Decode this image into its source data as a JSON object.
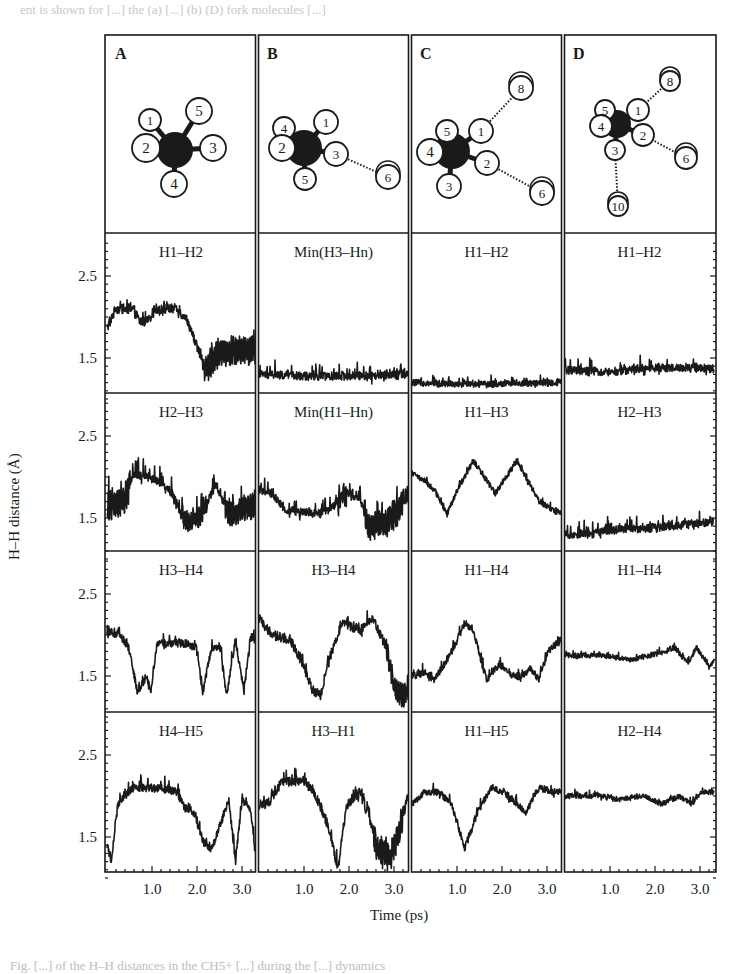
{
  "page": {
    "top_text_fragment": "ent is shown for [...] the (a) [...] (b) (D) fork molecules [...]",
    "bottom_caption_fragment": "Fig. [...] of the H–H distances in the CH5+ [...] during the [...] dynamics"
  },
  "figure": {
    "columns": [
      {
        "label": "A"
      },
      {
        "label": "B"
      },
      {
        "label": "C"
      },
      {
        "label": "D"
      }
    ],
    "molecules": [
      {
        "panel": "A",
        "center": [
          175,
          150
        ],
        "atoms": [
          {
            "n": "1",
            "x": 150,
            "y": 120,
            "r": 11
          },
          {
            "n": "2",
            "x": 146,
            "y": 148,
            "r": 14
          },
          {
            "n": "3",
            "x": 213,
            "y": 148,
            "r": 13
          },
          {
            "n": "4",
            "x": 174,
            "y": 184,
            "r": 13
          },
          {
            "n": "5",
            "x": 199,
            "y": 111,
            "r": 13
          }
        ],
        "bonds_dotted": []
      },
      {
        "panel": "B",
        "center": [
          304,
          148
        ],
        "atoms": [
          {
            "n": "4",
            "x": 284,
            "y": 128,
            "r": 11
          },
          {
            "n": "1",
            "x": 326,
            "y": 122,
            "r": 12
          },
          {
            "n": "2",
            "x": 282,
            "y": 148,
            "r": 13
          },
          {
            "n": "3",
            "x": 336,
            "y": 154,
            "r": 12
          },
          {
            "n": "5",
            "x": 305,
            "y": 179,
            "r": 11
          },
          {
            "n": "6",
            "x": 388,
            "y": 177,
            "r": 12
          }
        ],
        "bonds_dotted": [
          [
            "3",
            "6"
          ]
        ]
      },
      {
        "panel": "C",
        "center": [
          452,
          151
        ],
        "atoms": [
          {
            "n": "5",
            "x": 447,
            "y": 131,
            "r": 11
          },
          {
            "n": "4",
            "x": 430,
            "y": 152,
            "r": 13
          },
          {
            "n": "1",
            "x": 481,
            "y": 131,
            "r": 12
          },
          {
            "n": "2",
            "x": 487,
            "y": 163,
            "r": 12
          },
          {
            "n": "3",
            "x": 449,
            "y": 186,
            "r": 12
          },
          {
            "n": "6",
            "x": 542,
            "y": 193,
            "r": 12
          },
          {
            "n": "8",
            "x": 521,
            "y": 88,
            "r": 12
          }
        ],
        "bonds_dotted": [
          [
            "1",
            "8"
          ],
          [
            "2",
            "6"
          ]
        ]
      },
      {
        "panel": "D",
        "center": [
          617,
          124
        ],
        "atoms": [
          {
            "n": "5",
            "x": 605,
            "y": 110,
            "r": 10
          },
          {
            "n": "4",
            "x": 601,
            "y": 126,
            "r": 11
          },
          {
            "n": "1",
            "x": 638,
            "y": 110,
            "r": 11
          },
          {
            "n": "2",
            "x": 643,
            "y": 135,
            "r": 11
          },
          {
            "n": "3",
            "x": 615,
            "y": 150,
            "r": 10
          },
          {
            "n": "6",
            "x": 686,
            "y": 158,
            "r": 11
          },
          {
            "n": "8",
            "x": 670,
            "y": 81,
            "r": 10
          },
          {
            "n": "10",
            "x": 618,
            "y": 206,
            "r": 10
          }
        ],
        "bonds_dotted": [
          [
            "1",
            "8"
          ],
          [
            "2",
            "6"
          ],
          [
            "3",
            "10"
          ]
        ]
      }
    ],
    "y_axis_label": "H–H distance (Å)",
    "x_axis_label": "Time (ps)",
    "y_ticks": [
      "2.5",
      "1.5"
    ],
    "x_ticks": [
      "1.0",
      "2.0",
      "3.0"
    ]
  },
  "chart_data": {
    "type": "line",
    "title": "",
    "xlabel": "Time (ps)",
    "ylabel": "H–H distance (Å)",
    "xlim": [
      0,
      3.4
    ],
    "ylim": [
      1.0,
      2.95
    ],
    "x_ticks": [
      1.0,
      2.0,
      3.0
    ],
    "y_ticks": [
      1.5,
      2.5
    ],
    "grid": false,
    "legend": "none",
    "panels": [
      {
        "column": "A",
        "row": 1,
        "label": "H1–H2",
        "noise": 0.06,
        "spike": 0.05,
        "profile": [
          [
            0,
            1.85
          ],
          [
            0.2,
            2.1
          ],
          [
            0.6,
            2.1
          ],
          [
            0.75,
            1.95
          ],
          [
            0.95,
            1.95
          ],
          [
            1.1,
            2.1
          ],
          [
            1.6,
            2.1
          ],
          [
            1.85,
            1.95
          ],
          [
            2.1,
            1.6
          ],
          [
            2.25,
            1.35
          ],
          [
            2.5,
            1.55
          ],
          [
            3.0,
            1.6
          ],
          [
            3.4,
            1.6
          ]
        ],
        "osc": [
          [
            2.2,
            3.4,
            0.25
          ]
        ]
      },
      {
        "column": "B",
        "row": 1,
        "label": "Min(H3–Hn)",
        "noise": 0.05,
        "spike": 0.12,
        "profile": [
          [
            0,
            1.3
          ],
          [
            1.0,
            1.28
          ],
          [
            2.0,
            1.28
          ],
          [
            3.4,
            1.3
          ]
        ]
      },
      {
        "column": "C",
        "row": 1,
        "label": "H1–H2",
        "noise": 0.04,
        "spike": 0.06,
        "profile": [
          [
            0,
            1.2
          ],
          [
            1.5,
            1.18
          ],
          [
            3.4,
            1.2
          ]
        ]
      },
      {
        "column": "D",
        "row": 1,
        "label": "H1–H2",
        "noise": 0.05,
        "spike": 0.1,
        "profile": [
          [
            0,
            1.35
          ],
          [
            1.0,
            1.33
          ],
          [
            2.0,
            1.38
          ],
          [
            3.4,
            1.37
          ]
        ]
      },
      {
        "column": "A",
        "row": 2,
        "label": "H2–H3",
        "noise": 0.05,
        "spike": 0.15,
        "profile": [
          [
            0,
            1.65
          ],
          [
            0.4,
            1.7
          ],
          [
            0.6,
            2.05
          ],
          [
            1.2,
            1.95
          ],
          [
            1.5,
            1.8
          ],
          [
            1.8,
            1.45
          ],
          [
            2.1,
            1.5
          ],
          [
            2.5,
            1.9
          ],
          [
            2.8,
            1.55
          ],
          [
            3.1,
            1.6
          ],
          [
            3.4,
            1.65
          ]
        ],
        "osc": [
          [
            0,
            0.5,
            0.3
          ],
          [
            1.7,
            2.3,
            0.2
          ],
          [
            2.7,
            3.4,
            0.25
          ]
        ]
      },
      {
        "column": "B",
        "row": 2,
        "label": "Min(H1–Hn)",
        "noise": 0.05,
        "spike": 0.12,
        "profile": [
          [
            0,
            1.85
          ],
          [
            0.3,
            1.8
          ],
          [
            0.6,
            1.6
          ],
          [
            1.3,
            1.55
          ],
          [
            1.6,
            1.6
          ],
          [
            2.0,
            1.8
          ],
          [
            2.3,
            1.75
          ],
          [
            2.5,
            1.4
          ],
          [
            2.9,
            1.45
          ],
          [
            3.2,
            1.6
          ],
          [
            3.4,
            1.75
          ]
        ],
        "osc": [
          [
            1.8,
            2.0,
            0.2
          ],
          [
            2.4,
            3.3,
            0.25
          ]
        ]
      },
      {
        "column": "C",
        "row": 2,
        "label": "H1–H3",
        "noise": 0.035,
        "spike": 0.03,
        "profile": [
          [
            0,
            2.05
          ],
          [
            0.3,
            1.95
          ],
          [
            0.5,
            1.85
          ],
          [
            0.8,
            1.55
          ],
          [
            1.0,
            1.8
          ],
          [
            1.4,
            2.2
          ],
          [
            1.9,
            1.8
          ],
          [
            2.4,
            2.2
          ],
          [
            2.6,
            2.0
          ],
          [
            2.9,
            1.7
          ],
          [
            3.4,
            1.55
          ]
        ]
      },
      {
        "column": "D",
        "row": 2,
        "label": "H2–H3",
        "noise": 0.05,
        "spike": 0.1,
        "profile": [
          [
            0,
            1.3
          ],
          [
            0.6,
            1.3
          ],
          [
            1.0,
            1.35
          ],
          [
            2.0,
            1.38
          ],
          [
            3.4,
            1.45
          ]
        ]
      },
      {
        "column": "A",
        "row": 3,
        "label": "H3–H4",
        "noise": 0.05,
        "spike": 0.08,
        "profile": [
          [
            0,
            2.05
          ],
          [
            0.3,
            2.0
          ],
          [
            0.5,
            1.85
          ],
          [
            0.7,
            1.3
          ],
          [
            0.9,
            1.5
          ],
          [
            1.0,
            1.3
          ],
          [
            1.15,
            1.9
          ],
          [
            1.8,
            1.9
          ],
          [
            2.05,
            1.85
          ],
          [
            2.2,
            1.3
          ],
          [
            2.4,
            1.85
          ],
          [
            2.6,
            1.85
          ],
          [
            2.75,
            1.25
          ],
          [
            2.95,
            1.95
          ],
          [
            3.15,
            1.3
          ],
          [
            3.3,
            2.0
          ],
          [
            3.4,
            1.95
          ]
        ]
      },
      {
        "column": "B",
        "row": 3,
        "label": "H3–H4",
        "noise": 0.06,
        "spike": 0.08,
        "profile": [
          [
            0,
            2.2
          ],
          [
            0.3,
            2.0
          ],
          [
            0.7,
            1.95
          ],
          [
            1.0,
            1.65
          ],
          [
            1.2,
            1.35
          ],
          [
            1.4,
            1.25
          ],
          [
            1.6,
            1.7
          ],
          [
            1.9,
            2.15
          ],
          [
            2.3,
            2.05
          ],
          [
            2.6,
            2.2
          ],
          [
            2.9,
            1.85
          ],
          [
            3.1,
            1.35
          ],
          [
            3.3,
            1.25
          ],
          [
            3.4,
            1.35
          ]
        ],
        "osc": [
          [
            2.9,
            3.4,
            0.2
          ]
        ]
      },
      {
        "column": "C",
        "row": 3,
        "label": "H1–H4",
        "noise": 0.045,
        "spike": 0.06,
        "profile": [
          [
            0,
            1.5
          ],
          [
            0.3,
            1.55
          ],
          [
            0.5,
            1.45
          ],
          [
            0.8,
            1.7
          ],
          [
            1.0,
            1.9
          ],
          [
            1.2,
            2.15
          ],
          [
            1.4,
            2.05
          ],
          [
            1.7,
            1.45
          ],
          [
            2.0,
            1.65
          ],
          [
            2.3,
            1.5
          ],
          [
            2.5,
            1.5
          ],
          [
            2.7,
            1.6
          ],
          [
            2.9,
            1.45
          ],
          [
            3.1,
            1.8
          ],
          [
            3.4,
            1.95
          ]
        ]
      },
      {
        "column": "D",
        "row": 3,
        "label": "H1–H4",
        "noise": 0.03,
        "spike": 0.04,
        "profile": [
          [
            0,
            1.75
          ],
          [
            0.8,
            1.75
          ],
          [
            1.5,
            1.7
          ],
          [
            2.2,
            1.78
          ],
          [
            2.5,
            1.85
          ],
          [
            2.8,
            1.65
          ],
          [
            3.0,
            1.85
          ],
          [
            3.3,
            1.6
          ],
          [
            3.4,
            1.7
          ]
        ]
      },
      {
        "column": "A",
        "row": 4,
        "label": "H4–H5",
        "noise": 0.05,
        "spike": 0.08,
        "profile": [
          [
            0,
            1.4
          ],
          [
            0.1,
            1.2
          ],
          [
            0.25,
            1.9
          ],
          [
            0.4,
            2.0
          ],
          [
            0.6,
            2.1
          ],
          [
            1.2,
            2.1
          ],
          [
            1.6,
            2.05
          ],
          [
            1.8,
            1.85
          ],
          [
            2.0,
            1.8
          ],
          [
            2.2,
            1.45
          ],
          [
            2.4,
            1.35
          ],
          [
            2.6,
            1.65
          ],
          [
            2.8,
            1.95
          ],
          [
            2.95,
            1.2
          ],
          [
            3.1,
            1.95
          ],
          [
            3.3,
            1.85
          ],
          [
            3.4,
            1.3
          ]
        ]
      },
      {
        "column": "B",
        "row": 4,
        "label": "H3–H1",
        "noise": 0.06,
        "spike": 0.1,
        "profile": [
          [
            0,
            1.9
          ],
          [
            0.2,
            1.9
          ],
          [
            0.5,
            2.15
          ],
          [
            1.0,
            2.2
          ],
          [
            1.3,
            2.0
          ],
          [
            1.6,
            1.6
          ],
          [
            1.8,
            1.1
          ],
          [
            2.0,
            1.9
          ],
          [
            2.3,
            2.05
          ],
          [
            2.5,
            1.75
          ],
          [
            2.7,
            1.35
          ],
          [
            3.0,
            1.25
          ],
          [
            3.2,
            1.55
          ],
          [
            3.4,
            2.0
          ]
        ],
        "osc": [
          [
            2.6,
            3.3,
            0.25
          ]
        ]
      },
      {
        "column": "C",
        "row": 4,
        "label": "H1–H5",
        "noise": 0.04,
        "spike": 0.06,
        "profile": [
          [
            0,
            1.9
          ],
          [
            0.3,
            2.05
          ],
          [
            0.6,
            2.05
          ],
          [
            0.9,
            1.9
          ],
          [
            1.2,
            1.35
          ],
          [
            1.5,
            1.8
          ],
          [
            1.8,
            2.1
          ],
          [
            2.1,
            2.05
          ],
          [
            2.4,
            1.9
          ],
          [
            2.6,
            1.8
          ],
          [
            2.9,
            2.1
          ],
          [
            3.2,
            2.05
          ],
          [
            3.4,
            2.05
          ]
        ]
      },
      {
        "column": "D",
        "row": 4,
        "label": "H2–H4",
        "noise": 0.03,
        "spike": 0.04,
        "profile": [
          [
            0,
            2.0
          ],
          [
            0.8,
            2.0
          ],
          [
            1.2,
            1.95
          ],
          [
            1.8,
            2.0
          ],
          [
            2.2,
            1.9
          ],
          [
            2.6,
            2.0
          ],
          [
            2.9,
            1.9
          ],
          [
            3.1,
            2.05
          ],
          [
            3.4,
            2.05
          ]
        ]
      }
    ]
  },
  "colors": {
    "ink": "#1a1a1a",
    "background": "#ffffff"
  }
}
